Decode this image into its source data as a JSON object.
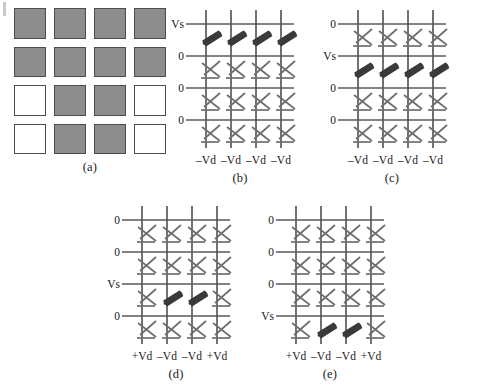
{
  "figure": {
    "type": "crossbar-array-write-scheme",
    "panel_count": 5,
    "array_rows": 4,
    "array_cols": 4,
    "colors": {
      "line": "#5a5a5a",
      "cell_unselected": "#6e6e6e",
      "cell_selected": "#3a3a3a",
      "pixel_on": "#8d8d8d",
      "pixel_off": "#ffffff",
      "pixel_border": "#4d4d4d",
      "text": "#1a1a1a"
    }
  },
  "panels": [
    {
      "id": "a",
      "caption": "(a)",
      "kind": "pixel-map",
      "rows": 4,
      "cols": 4,
      "pixels": [
        [
          1,
          1,
          1,
          1
        ],
        [
          1,
          1,
          1,
          1
        ],
        [
          0,
          1,
          1,
          0
        ],
        [
          0,
          1,
          1,
          0
        ]
      ]
    },
    {
      "id": "b",
      "caption": "(b)",
      "kind": "crossbar",
      "row_labels": [
        "Vs",
        "0",
        "0",
        "0"
      ],
      "col_labels": [
        "–Vd",
        "–Vd",
        "–Vd",
        "–Vd"
      ],
      "selected": [
        [
          1,
          1,
          1,
          1
        ],
        [
          0,
          0,
          0,
          0
        ],
        [
          0,
          0,
          0,
          0
        ],
        [
          0,
          0,
          0,
          0
        ]
      ]
    },
    {
      "id": "c",
      "caption": "(c)",
      "kind": "crossbar",
      "row_labels": [
        "0",
        "Vs",
        "0",
        "0"
      ],
      "col_labels": [
        "–Vd",
        "–Vd",
        "–Vd",
        "–Vd"
      ],
      "selected": [
        [
          0,
          0,
          0,
          0
        ],
        [
          1,
          1,
          1,
          1
        ],
        [
          0,
          0,
          0,
          0
        ],
        [
          0,
          0,
          0,
          0
        ]
      ]
    },
    {
      "id": "d",
      "caption": "(d)",
      "kind": "crossbar",
      "row_labels": [
        "0",
        "0",
        "Vs",
        "0"
      ],
      "col_labels": [
        "+Vd",
        "–Vd",
        "–Vd",
        "+Vd"
      ],
      "selected": [
        [
          0,
          0,
          0,
          0
        ],
        [
          0,
          0,
          0,
          0
        ],
        [
          0,
          1,
          1,
          0
        ],
        [
          0,
          0,
          0,
          0
        ]
      ]
    },
    {
      "id": "e",
      "caption": "(e)",
      "kind": "crossbar",
      "row_labels": [
        "0",
        "0",
        "0",
        "Vs"
      ],
      "col_labels": [
        "+Vd",
        "–Vd",
        "–Vd",
        "+Vd"
      ],
      "selected": [
        [
          0,
          0,
          0,
          0
        ],
        [
          0,
          0,
          0,
          0
        ],
        [
          0,
          0,
          0,
          0
        ],
        [
          0,
          1,
          1,
          0
        ]
      ]
    }
  ]
}
